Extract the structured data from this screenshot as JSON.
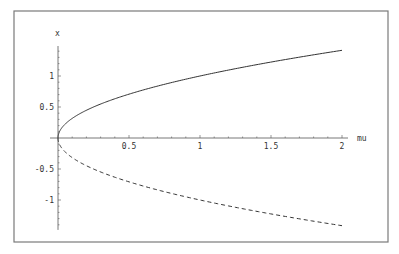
{
  "chart_data": {
    "type": "line",
    "title": "",
    "xlabel": "mu",
    "ylabel": "x",
    "xlim": [
      0,
      2
    ],
    "ylim": [
      -1.45,
      1.5
    ],
    "grid": false,
    "legend": null,
    "x_ticks": [
      {
        "value": 0.5,
        "label": "0.5"
      },
      {
        "value": 1,
        "label": "1"
      },
      {
        "value": 1.5,
        "label": "1.5"
      },
      {
        "value": 2,
        "label": "2"
      }
    ],
    "y_ticks": [
      {
        "value": 1,
        "label": "1"
      },
      {
        "value": 0.5,
        "label": "0.5"
      },
      {
        "value": -0.5,
        "label": "-0.5"
      },
      {
        "value": -1,
        "label": "-1"
      }
    ],
    "series": [
      {
        "name": "x = sqrt(mu)",
        "style": "solid",
        "x": [
          0,
          0.01,
          0.05,
          0.1,
          0.25,
          0.5,
          0.75,
          1,
          1.25,
          1.5,
          1.75,
          2
        ],
        "y": [
          0,
          0.1,
          0.224,
          0.316,
          0.5,
          0.707,
          0.866,
          1,
          1.118,
          1.225,
          1.323,
          1.414
        ]
      },
      {
        "name": "x = -sqrt(mu)",
        "style": "dashed",
        "x": [
          0,
          0.01,
          0.05,
          0.1,
          0.25,
          0.5,
          0.75,
          1,
          1.25,
          1.5,
          1.75,
          2
        ],
        "y": [
          0,
          -0.1,
          -0.224,
          -0.316,
          -0.5,
          -0.707,
          -0.866,
          -1,
          -1.118,
          -1.225,
          -1.323,
          -1.414
        ]
      }
    ]
  },
  "colors": {
    "frame": "#7a7a7a",
    "axis": "#555555",
    "curve": "#333333",
    "background": "#ffffff"
  }
}
